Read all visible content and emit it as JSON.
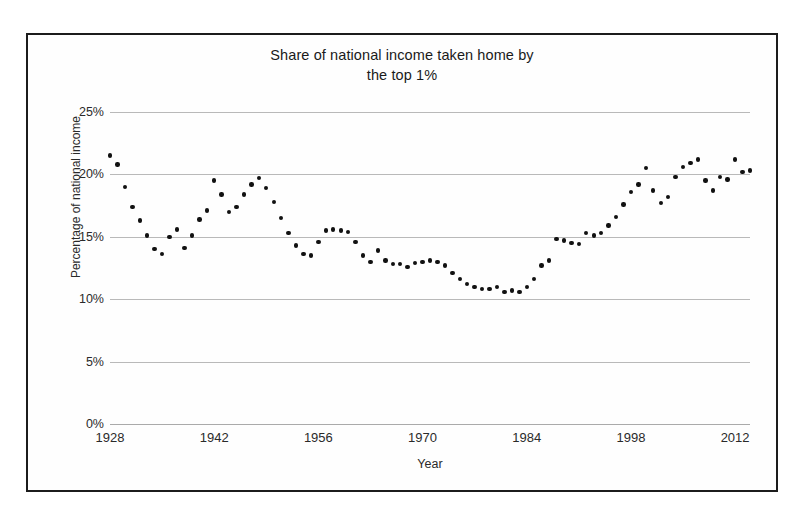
{
  "chart_data": {
    "type": "scatter",
    "title": "Share of national income taken home by the top 1%",
    "title_lines": [
      "Share of national income taken home by",
      "the top 1%"
    ],
    "xlabel": "Year",
    "ylabel": "Percentage of national income",
    "xlim": [
      1928,
      2014
    ],
    "ylim": [
      0,
      25
    ],
    "xticks": [
      1928,
      1942,
      1956,
      1970,
      1984,
      1998,
      2012
    ],
    "xtick_labels": [
      "1928",
      "1942",
      "1956",
      "1970",
      "1984",
      "1998",
      "2012"
    ],
    "yticks": [
      0,
      5,
      10,
      15,
      20,
      25
    ],
    "ytick_labels": [
      "0%",
      "5%",
      "10%",
      "15%",
      "20%",
      "25%"
    ],
    "grid": true,
    "grid_axis": "y",
    "legend": false,
    "marker": "circle",
    "marker_color": "#111111",
    "x": [
      1928,
      1929,
      1930,
      1931,
      1932,
      1933,
      1934,
      1935,
      1936,
      1937,
      1938,
      1939,
      1940,
      1941,
      1942,
      1943,
      1944,
      1945,
      1946,
      1947,
      1948,
      1949,
      1950,
      1951,
      1952,
      1953,
      1954,
      1955,
      1956,
      1957,
      1958,
      1959,
      1960,
      1961,
      1962,
      1963,
      1964,
      1965,
      1966,
      1967,
      1968,
      1969,
      1970,
      1971,
      1972,
      1973,
      1974,
      1975,
      1976,
      1977,
      1978,
      1979,
      1980,
      1981,
      1982,
      1983,
      1984,
      1985,
      1986,
      1987,
      1988,
      1989,
      1990,
      1991,
      1992,
      1993,
      1994,
      1995,
      1996,
      1997,
      1998,
      1999,
      2000,
      2001,
      2002,
      2003,
      2004,
      2005,
      2006,
      2007,
      2008,
      2009,
      2010,
      2011,
      2012,
      2013,
      2014
    ],
    "y": [
      21.5,
      20.8,
      19.0,
      17.4,
      16.3,
      15.1,
      14.0,
      13.6,
      15.0,
      15.6,
      14.1,
      15.1,
      16.4,
      17.1,
      19.5,
      18.4,
      17.0,
      17.4,
      18.4,
      19.2,
      19.7,
      18.9,
      17.8,
      16.5,
      15.3,
      14.3,
      13.6,
      13.5,
      14.6,
      15.5,
      15.6,
      15.5,
      15.4,
      14.6,
      13.5,
      13.0,
      13.9,
      13.1,
      12.8,
      12.8,
      12.6,
      12.9,
      13.0,
      13.1,
      13.0,
      12.7,
      12.1,
      11.6,
      11.2,
      11.0,
      10.8,
      10.8,
      11.0,
      10.6,
      10.7,
      10.6,
      11.0,
      11.6,
      12.7,
      13.1,
      14.8,
      14.7,
      14.5,
      14.4,
      15.3,
      15.1,
      15.3,
      15.9,
      16.6,
      17.6,
      18.6,
      19.2,
      20.5,
      18.7,
      17.7,
      18.2,
      19.8,
      20.6,
      20.9,
      21.2,
      19.5,
      18.7,
      19.8,
      19.6,
      21.2,
      20.2,
      20.3
    ],
    "n_points": 87
  }
}
